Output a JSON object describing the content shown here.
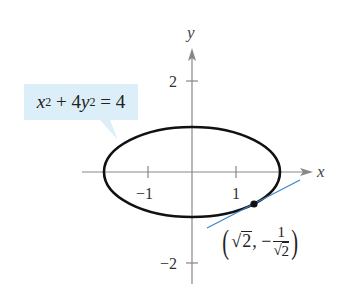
{
  "figure": {
    "equation_label": {
      "lhs_x": "x",
      "lhs_x_exp": "2",
      "plus_coef": " + 4",
      "lhs_y": "y",
      "lhs_y_exp": "2",
      "rhs": " = 4"
    },
    "axes": {
      "x_label": "x",
      "y_label": "y",
      "x_ticks": [
        {
          "value": -1,
          "label": "−1"
        },
        {
          "value": 1,
          "label": "1"
        }
      ],
      "y_ticks": [
        {
          "value": 2,
          "label": "2"
        },
        {
          "value": -2,
          "label": "−2"
        }
      ]
    },
    "point_label": {
      "open": "(",
      "x_rad": "√",
      "x_radicand": "2",
      "comma": ", −",
      "frac_num": "1",
      "frac_den_rad": "√",
      "frac_den_radicand": "2",
      "close": ")"
    },
    "colors": {
      "curve": "#111111",
      "axis": "#777777",
      "tangent": "#3a86c8",
      "label_bg": "#dceef7"
    }
  }
}
